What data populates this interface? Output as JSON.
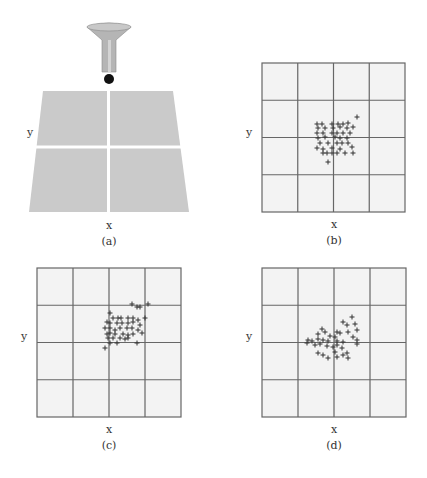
{
  "figure": {
    "colors": {
      "background": "#ffffff",
      "grid_fill": "#f3f3f3",
      "grid_line": "#666666",
      "target_fill": "#cacaca",
      "target_gap": "#ffffff",
      "funnel_fill": "#b5b5b5",
      "funnel_stroke": "#8a8a8a",
      "ball": "#111111",
      "marker": "#333333"
    },
    "panel_a": {
      "caption": "(a)",
      "x_label": "x",
      "y_label": "y",
      "funnel": {
        "cx": 109,
        "top_y": 27,
        "top_rx": 22,
        "top_ry": 4,
        "stem_left": 102,
        "stem_right": 116,
        "neck_y": 40,
        "stem_bottom_y": 72
      },
      "ball": {
        "cx": 109,
        "cy": 79,
        "r": 5
      },
      "target": {
        "top_y": 91,
        "top_left": 43,
        "top_right": 173,
        "bottom_y": 212,
        "bottom_left": 29,
        "bottom_right": 189,
        "mid_y": 147,
        "mid_x": 108.5,
        "gap": 3
      },
      "x_label_pos": [
        109,
        229
      ],
      "y_label_pos": [
        30,
        136
      ],
      "caption_pos": [
        109,
        245
      ]
    },
    "panels": [
      {
        "id": "b",
        "caption": "(b)",
        "x_label": "x",
        "y_label": "y",
        "grid": {
          "x": 262,
          "y": 63,
          "w": 143,
          "h": 149,
          "cols": 4,
          "rows": 4
        },
        "x_label_pos": [
          334,
          228
        ],
        "y_label_pos": [
          249,
          136
        ],
        "caption_pos": [
          334,
          244
        ],
        "points": [
          [
            357,
            117
          ],
          [
            317,
            124
          ],
          [
            322,
            124
          ],
          [
            332,
            124
          ],
          [
            338,
            124
          ],
          [
            343,
            124
          ],
          [
            348,
            123
          ],
          [
            318,
            128
          ],
          [
            325,
            128
          ],
          [
            333,
            128
          ],
          [
            340,
            127
          ],
          [
            347,
            128
          ],
          [
            353,
            127
          ],
          [
            317,
            133
          ],
          [
            323,
            133
          ],
          [
            332,
            133
          ],
          [
            337,
            133
          ],
          [
            343,
            133
          ],
          [
            350,
            133
          ],
          [
            318,
            138
          ],
          [
            325,
            137
          ],
          [
            335,
            137
          ],
          [
            340,
            138
          ],
          [
            347,
            138
          ],
          [
            320,
            143
          ],
          [
            328,
            143
          ],
          [
            337,
            143
          ],
          [
            342,
            143
          ],
          [
            348,
            143
          ],
          [
            317,
            148
          ],
          [
            323,
            149
          ],
          [
            332,
            148
          ],
          [
            340,
            149
          ],
          [
            352,
            147
          ],
          [
            323,
            153
          ],
          [
            327,
            153
          ],
          [
            332,
            153
          ],
          [
            337,
            153
          ],
          [
            345,
            153
          ],
          [
            353,
            153
          ],
          [
            328,
            162
          ]
        ]
      },
      {
        "id": "c",
        "caption": "(c)",
        "x_label": "x",
        "y_label": "y",
        "grid": {
          "x": 37,
          "y": 268,
          "w": 144,
          "h": 149,
          "cols": 4,
          "rows": 4
        },
        "x_label_pos": [
          109,
          433
        ],
        "y_label_pos": [
          24,
          340
        ],
        "caption_pos": [
          109,
          449
        ],
        "points": [
          [
            132,
            304
          ],
          [
            137,
            307
          ],
          [
            140,
            307
          ],
          [
            148,
            304
          ],
          [
            145,
            318
          ],
          [
            110,
            313
          ],
          [
            113,
            318
          ],
          [
            118,
            318
          ],
          [
            121,
            318
          ],
          [
            128,
            318
          ],
          [
            133,
            318
          ],
          [
            138,
            320
          ],
          [
            107,
            322
          ],
          [
            110,
            323
          ],
          [
            117,
            323
          ],
          [
            122,
            323
          ],
          [
            128,
            323
          ],
          [
            133,
            322
          ],
          [
            140,
            325
          ],
          [
            105,
            328
          ],
          [
            110,
            328
          ],
          [
            115,
            330
          ],
          [
            120,
            328
          ],
          [
            127,
            328
          ],
          [
            132,
            328
          ],
          [
            138,
            330
          ],
          [
            107,
            334
          ],
          [
            110,
            333
          ],
          [
            115,
            334
          ],
          [
            123,
            334
          ],
          [
            128,
            335
          ],
          [
            133,
            334
          ],
          [
            142,
            333
          ],
          [
            108,
            338
          ],
          [
            113,
            338
          ],
          [
            120,
            338
          ],
          [
            125,
            339
          ],
          [
            128,
            338
          ],
          [
            110,
            343
          ],
          [
            117,
            343
          ],
          [
            137,
            343
          ],
          [
            105,
            348
          ]
        ]
      },
      {
        "id": "d",
        "caption": "(d)",
        "x_label": "x",
        "y_label": "y",
        "grid": {
          "x": 262,
          "y": 268,
          "w": 144,
          "h": 149,
          "cols": 4,
          "rows": 4
        },
        "x_label_pos": [
          334,
          433
        ],
        "y_label_pos": [
          249,
          340
        ],
        "caption_pos": [
          334,
          449
        ],
        "points": [
          [
            352,
            317
          ],
          [
            343,
            322
          ],
          [
            347,
            325
          ],
          [
            355,
            324
          ],
          [
            322,
            329
          ],
          [
            325,
            332
          ],
          [
            337,
            332
          ],
          [
            340,
            333
          ],
          [
            348,
            332
          ],
          [
            357,
            330
          ],
          [
            318,
            334
          ],
          [
            330,
            336
          ],
          [
            335,
            337
          ],
          [
            353,
            337
          ],
          [
            308,
            340
          ],
          [
            312,
            341
          ],
          [
            318,
            339
          ],
          [
            323,
            340
          ],
          [
            328,
            341
          ],
          [
            337,
            341
          ],
          [
            343,
            342
          ],
          [
            357,
            340
          ],
          [
            307,
            343
          ],
          [
            315,
            345
          ],
          [
            320,
            344
          ],
          [
            327,
            346
          ],
          [
            333,
            347
          ],
          [
            337,
            345
          ],
          [
            342,
            348
          ],
          [
            357,
            344
          ],
          [
            318,
            353
          ],
          [
            323,
            355
          ],
          [
            328,
            358
          ],
          [
            335,
            352
          ],
          [
            337,
            357
          ],
          [
            343,
            355
          ],
          [
            347,
            353
          ],
          [
            348,
            358
          ]
        ]
      }
    ]
  }
}
